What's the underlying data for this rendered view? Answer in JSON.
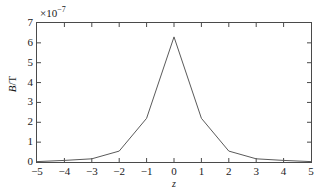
{
  "chart_data": {
    "type": "line",
    "title": "",
    "xlabel": "z",
    "ylabel": "B/T",
    "y_multiplier": "×10",
    "y_multiplier_exp": "−7",
    "y_multiplier_full": "×10⁻⁷",
    "xlim": [
      -5,
      5
    ],
    "ylim": [
      0,
      7
    ],
    "xticks": [
      -5,
      -4,
      -3,
      -2,
      -1,
      0,
      1,
      2,
      3,
      4,
      5
    ],
    "xtick_labels": [
      "−5",
      "−4",
      "−3",
      "−2",
      "−1",
      "0",
      "1",
      "2",
      "3",
      "4",
      "5"
    ],
    "yticks": [
      0,
      1,
      2,
      3,
      4,
      5,
      6,
      7
    ],
    "ytick_labels": [
      "0",
      "1",
      "2",
      "3",
      "4",
      "5",
      "6",
      "7"
    ],
    "grid": false,
    "legend": null,
    "legend_position": "none",
    "series": [
      {
        "name": "B",
        "color": "#5a5a5a",
        "x": [
          -5,
          -4,
          -3,
          -2,
          -1,
          0,
          1,
          2,
          3,
          4,
          5
        ],
        "values": [
          0.02,
          0.08,
          0.16,
          0.55,
          2.2,
          6.3,
          2.2,
          0.55,
          0.16,
          0.08,
          0.02
        ]
      }
    ]
  },
  "axis_style": {
    "frame_color": "#4a4a4a",
    "tick_direction": "in",
    "box": true
  }
}
